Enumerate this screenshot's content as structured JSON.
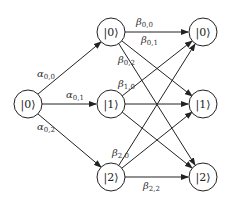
{
  "diagram": {
    "type": "layered-transition-graph",
    "nodes": {
      "source": {
        "label": "|0⟩",
        "x": 28,
        "y": 104
      },
      "middle": [
        {
          "label": "|0⟩",
          "x": 111,
          "y": 32
        },
        {
          "label": "|1⟩",
          "x": 111,
          "y": 104
        },
        {
          "label": "|2⟩",
          "x": 111,
          "y": 177
        }
      ],
      "target": [
        {
          "label": "|0⟩",
          "x": 203,
          "y": 32
        },
        {
          "label": "|1⟩",
          "x": 203,
          "y": 104
        },
        {
          "label": "|2⟩",
          "x": 203,
          "y": 177
        }
      ]
    },
    "edge_labels": {
      "alpha_0_0": {
        "sym": "α",
        "sub": "0,0"
      },
      "alpha_0_1": {
        "sym": "α",
        "sub": "0,1"
      },
      "alpha_0_2": {
        "sym": "α",
        "sub": "0,2"
      },
      "beta_0_0": {
        "sym": "β",
        "sub": "0,0"
      },
      "beta_0_1": {
        "sym": "β",
        "sub": "0,1"
      },
      "beta_0_2": {
        "sym": "β",
        "sub": "0,2"
      },
      "beta_1_0": {
        "sym": "β",
        "sub": "1,0"
      },
      "beta_2_0": {
        "sym": "β",
        "sub": "2,0"
      },
      "beta_2_2": {
        "sym": "β",
        "sub": "2,2"
      }
    }
  }
}
